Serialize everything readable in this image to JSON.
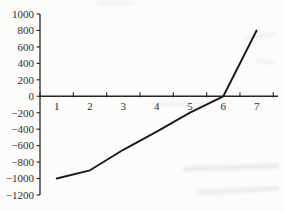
{
  "chart_data": {
    "type": "line",
    "categories": [
      "1",
      "2",
      "3",
      "4",
      "5",
      "6",
      "7"
    ],
    "series": [
      {
        "name": "series-1",
        "values": [
          -1000,
          -900,
          -650,
          -430,
          -200,
          0,
          800
        ]
      }
    ],
    "title": "",
    "xlabel": "",
    "ylabel": "",
    "ylim": [
      -1200,
      1000
    ],
    "ytick_step": 200,
    "y_tick_labels": [
      "1000",
      "800",
      "600",
      "400",
      "200",
      "0",
      "−200",
      "−400",
      "−600",
      "−800",
      "−1000",
      "−1200"
    ],
    "x_tick_labels": [
      "1",
      "2",
      "3",
      "4",
      "5",
      "6",
      "7"
    ],
    "grid": false,
    "legend": "none",
    "line_color": "#1a1a1a",
    "axis_color": "#262626",
    "label_color": "#2e2e2e",
    "background_color": "#fcfcfb"
  }
}
